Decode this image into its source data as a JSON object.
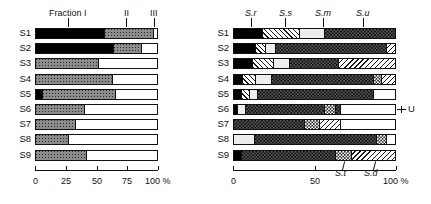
{
  "chart_data": [
    {
      "id": "left",
      "type": "bar",
      "orientation": "horizontal",
      "stacked": true,
      "title": "",
      "xlabel": "100 %",
      "ylabel": "",
      "xlim": [
        0,
        100
      ],
      "grid": false,
      "legend_position": "top",
      "axis_ticks": [
        "0",
        "25",
        "50",
        "75",
        "100 %"
      ],
      "axis_tick_values": [
        0,
        25,
        50,
        75,
        100
      ],
      "top_annotations": [
        {
          "label": "Fraction I",
          "value": 27,
          "style": "roman"
        },
        {
          "label": "II",
          "value": 74,
          "style": "roman"
        },
        {
          "label": "III",
          "value": 97,
          "style": "roman"
        }
      ],
      "categories": [
        "S1",
        "S2",
        "S3",
        "S4",
        "S5",
        "S6",
        "S7",
        "S8",
        "S9"
      ],
      "series": [
        {
          "name": "Fraction I",
          "fill": "black",
          "values": [
            55,
            63,
            0,
            0,
            5,
            0,
            0,
            0,
            0
          ]
        },
        {
          "name": "Fraction II",
          "fill": "gray-dot",
          "values": [
            40,
            22,
            50,
            62,
            59,
            39,
            32,
            26,
            41
          ]
        },
        {
          "name": "Fraction III",
          "fill": "white",
          "values": [
            5,
            15,
            50,
            38,
            36,
            61,
            68,
            74,
            59
          ]
        }
      ]
    },
    {
      "id": "right",
      "type": "bar",
      "orientation": "horizontal",
      "stacked": true,
      "title": "",
      "xlabel": "100 %",
      "ylabel": "",
      "xlim": [
        0,
        100
      ],
      "grid": false,
      "legend_position": "top",
      "axis_ticks": [
        "0",
        "50",
        "100 %"
      ],
      "axis_tick_values": [
        0,
        50,
        100
      ],
      "top_annotations": [
        {
          "label": "S.r",
          "value": 11,
          "style": "italic"
        },
        {
          "label": "S.s",
          "value": 32,
          "style": "italic"
        },
        {
          "label": "S.m",
          "value": 55,
          "style": "italic"
        },
        {
          "label": "S.u",
          "value": 80,
          "style": "italic"
        }
      ],
      "bottom_annotations": [
        {
          "label": "S.t",
          "value": 67,
          "style": "italic"
        },
        {
          "label": "S.d",
          "value": 86,
          "style": "italic"
        }
      ],
      "side_annotations": [
        {
          "label": "U",
          "row": "S6"
        }
      ],
      "categories": [
        "S1",
        "S2",
        "S3",
        "S4",
        "S5",
        "S6",
        "S7",
        "S8",
        "S9"
      ],
      "rows": [
        {
          "category": "S1",
          "segments": [
            {
              "fill": "black",
              "width": 17
            },
            {
              "fill": "hatch-l",
              "width": 23
            },
            {
              "fill": "light",
              "width": 15
            },
            {
              "fill": "dark-dot",
              "width": 45
            }
          ]
        },
        {
          "category": "S2",
          "segments": [
            {
              "fill": "black",
              "width": 13
            },
            {
              "fill": "hatch-l",
              "width": 6
            },
            {
              "fill": "light",
              "width": 6
            },
            {
              "fill": "dark-dot",
              "width": 68
            },
            {
              "fill": "hatch-r",
              "width": 7
            }
          ]
        },
        {
          "category": "S3",
          "segments": [
            {
              "fill": "black",
              "width": 11
            },
            {
              "fill": "hatch-l",
              "width": 13
            },
            {
              "fill": "light",
              "width": 10
            },
            {
              "fill": "dark-dot",
              "width": 30
            },
            {
              "fill": "hatch-r",
              "width": 35
            },
            {
              "fill": "white",
              "width": 1
            }
          ]
        },
        {
          "category": "S4",
          "segments": [
            {
              "fill": "black",
              "width": 5
            },
            {
              "fill": "hatch-l",
              "width": 8
            },
            {
              "fill": "light",
              "width": 10
            },
            {
              "fill": "dark-dot",
              "width": 62
            },
            {
              "fill": "check",
              "width": 5
            },
            {
              "fill": "hatch-r",
              "width": 10
            }
          ]
        },
        {
          "category": "S5",
          "segments": [
            {
              "fill": "black",
              "width": 4
            },
            {
              "fill": "hatch-l",
              "width": 5
            },
            {
              "fill": "light",
              "width": 5
            },
            {
              "fill": "dark-dot",
              "width": 71
            },
            {
              "fill": "white",
              "width": 15
            }
          ]
        },
        {
          "category": "S6",
          "segments": [
            {
              "fill": "black",
              "width": 2
            },
            {
              "fill": "light",
              "width": 5
            },
            {
              "fill": "dark-dot",
              "width": 48
            },
            {
              "fill": "check",
              "width": 7
            },
            {
              "fill": "dark-dot",
              "width": 3
            },
            {
              "fill": "white",
              "width": 35
            }
          ]
        },
        {
          "category": "S7",
          "segments": [
            {
              "fill": "dark-dot",
              "width": 43
            },
            {
              "fill": "check",
              "width": 9
            },
            {
              "fill": "hatch-r",
              "width": 13
            },
            {
              "fill": "white",
              "width": 35
            }
          ]
        },
        {
          "category": "S8",
          "segments": [
            {
              "fill": "light",
              "width": 12
            },
            {
              "fill": "dark-dot",
              "width": 75
            },
            {
              "fill": "check",
              "width": 6
            },
            {
              "fill": "white",
              "width": 7
            }
          ]
        },
        {
          "category": "S9",
          "segments": [
            {
              "fill": "black",
              "width": 4
            },
            {
              "fill": "dark-dot",
              "width": 58
            },
            {
              "fill": "check",
              "width": 10
            },
            {
              "fill": "hatch-r",
              "width": 28
            }
          ]
        }
      ]
    }
  ]
}
